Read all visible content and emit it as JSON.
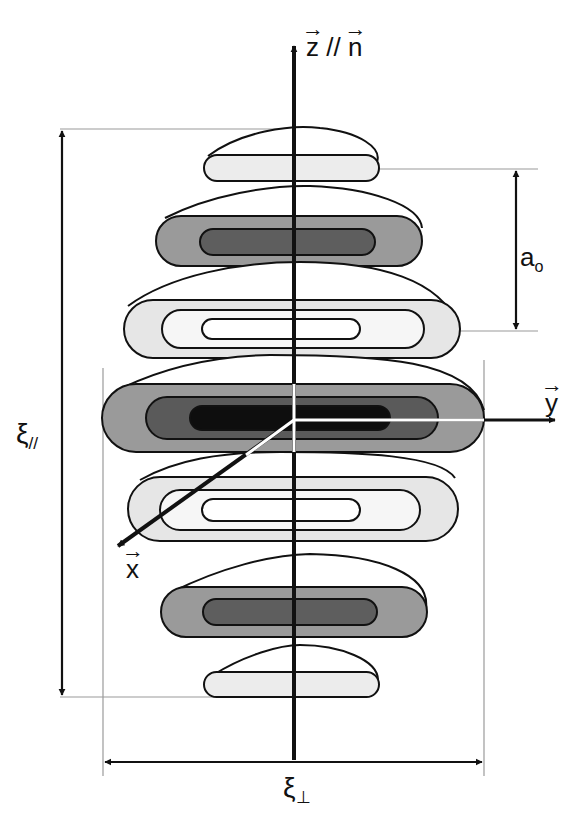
{
  "figure": {
    "axes": {
      "z": {
        "label": "z",
        "parallel_sign": "//",
        "normal_label": "n",
        "vector": true
      },
      "y": {
        "label": "y",
        "vector": true
      },
      "x": {
        "label": "x",
        "vector": true
      }
    },
    "dimensions": {
      "xi_parallel": {
        "symbol": "ξ",
        "subscript": "//"
      },
      "xi_perp": {
        "symbol": "ξ",
        "subscript": "⊥"
      },
      "a0": {
        "symbol": "a",
        "subscript": "o"
      }
    },
    "layers": [
      {
        "index": 1,
        "shading": [
          "#ececec"
        ]
      },
      {
        "index": 2,
        "shading": [
          "#9a9a9a",
          "#5e5e5e"
        ]
      },
      {
        "index": 3,
        "shading": [
          "#e6e6e6",
          "#f6f6f6",
          "#ffffff"
        ]
      },
      {
        "index": 4,
        "shading": [
          "#9a9a9a",
          "#5a5a5a",
          "#0e0e0e"
        ]
      },
      {
        "index": 5,
        "shading": [
          "#e6e6e6",
          "#f6f6f6",
          "#ffffff"
        ]
      },
      {
        "index": 6,
        "shading": [
          "#9a9a9a",
          "#5e5e5e"
        ]
      },
      {
        "index": 7,
        "shading": [
          "#ececec"
        ]
      }
    ],
    "colors": {
      "ink": "#111111",
      "guide": "#9a9a9a",
      "axis_highlight": "#ffffff"
    }
  }
}
